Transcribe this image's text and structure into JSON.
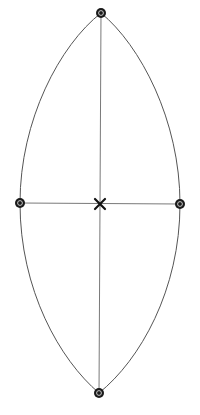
{
  "diagram": {
    "type": "pointed-ellipse-with-control-points",
    "colors": {
      "background": "#ffffff",
      "outline": "#555555",
      "axes": "#6a6a6a",
      "nodes": "#1a1a1a",
      "center_mark": "#111111"
    },
    "nodes": [
      {
        "id": "top",
        "label": ""
      },
      {
        "id": "left",
        "label": ""
      },
      {
        "id": "right",
        "label": ""
      },
      {
        "id": "bottom",
        "label": ""
      }
    ],
    "center": {
      "id": "center",
      "symbol": "cross-icon"
    },
    "edges": [
      {
        "from": "top",
        "to": "bottom",
        "kind": "axis"
      },
      {
        "from": "left",
        "to": "right",
        "kind": "axis"
      },
      {
        "from": "top",
        "to": "left",
        "kind": "curve"
      },
      {
        "from": "left",
        "to": "bottom",
        "kind": "curve"
      },
      {
        "from": "top",
        "to": "right",
        "kind": "curve"
      },
      {
        "from": "right",
        "to": "bottom",
        "kind": "curve"
      }
    ]
  }
}
